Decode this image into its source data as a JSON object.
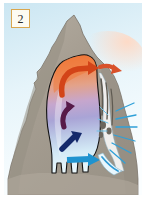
{
  "figure": {
    "number_badge": "2",
    "caption": "",
    "frame_color": "#ffffff",
    "badge_border_color": "#d9a64e",
    "badge_fill_color": "#fdfbf2"
  },
  "scene": {
    "title": "glacier-inside-mountain-cross-section",
    "sky": {
      "label": "sky",
      "color_top": "#cfe8f2",
      "color_bottom": "#f2fafd"
    },
    "mountain": {
      "label": "mountain",
      "rock_color": "#a8a094",
      "rock_shadow_color": "#8d8madd",
      "outline_color": "#6e6a60",
      "peak_label": "summit"
    },
    "ice_body": {
      "label": "ice-mass",
      "outline_color": "#1a1a1a",
      "gradient_stops": [
        {
          "offset": "0%",
          "color": "#f07a3c"
        },
        {
          "offset": "22%",
          "color": "#e8a080"
        },
        {
          "offset": "42%",
          "color": "#c9a8cf"
        },
        {
          "offset": "62%",
          "color": "#a7a3d4"
        },
        {
          "offset": "82%",
          "color": "#cfe6f4"
        },
        {
          "offset": "100%",
          "color": "#eaf7fc"
        }
      ],
      "lobes_label": "terminal-lobes"
    },
    "arrows": [
      {
        "name": "orange-flow-arrow",
        "color": "#d9441e",
        "label": "warm-flow"
      },
      {
        "name": "purple-flow-arrow",
        "color": "#5b1b4e",
        "label": "mid-flow"
      },
      {
        "name": "navy-flow-arrow",
        "color": "#152a6b",
        "label": "deep-flow"
      },
      {
        "name": "cyan-flow-arrow",
        "color": "#1f93cf",
        "label": "melt-outflow"
      }
    ],
    "outflow": {
      "label": "meltwater-outflow",
      "rock_streak_color": "#6f6b63",
      "spray_color": "#3aa3d6"
    }
  }
}
